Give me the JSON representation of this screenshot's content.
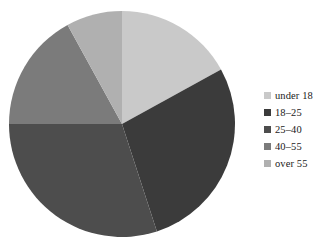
{
  "chart_data": {
    "type": "pie",
    "title": "",
    "xlabel": "",
    "ylabel": "",
    "grid": false,
    "legend_position": "right",
    "start_angle_deg": 0,
    "direction": "clockwise",
    "categories": [
      "under 18",
      "18–25",
      "25–40",
      "40–55",
      "over 55"
    ],
    "values": [
      17,
      28,
      30,
      17,
      8
    ],
    "units": "percent",
    "colors": [
      "#c9c9c9",
      "#3b3b3b",
      "#4d4d4d",
      "#7b7b7b",
      "#b0b0b0"
    ],
    "slices": [
      {
        "label": "under 18",
        "value": 17,
        "color": "#c9c9c9",
        "start_deg": 0,
        "end_deg": 61.2
      },
      {
        "label": "18–25",
        "value": 28,
        "color": "#3b3b3b",
        "start_deg": 61.2,
        "end_deg": 162.0
      },
      {
        "label": "25–40",
        "value": 30,
        "color": "#4d4d4d",
        "start_deg": 162.0,
        "end_deg": 270.0
      },
      {
        "label": "40–55",
        "value": 17,
        "color": "#7b7b7b",
        "start_deg": 270.0,
        "end_deg": 331.2
      },
      {
        "label": "over 55",
        "value": 8,
        "color": "#b0b0b0",
        "start_deg": 331.2,
        "end_deg": 360.0
      }
    ]
  },
  "legend": {
    "items": [
      {
        "label": "under 18",
        "color": "#c9c9c9"
      },
      {
        "label": "18–25",
        "color": "#3b3b3b"
      },
      {
        "label": "25–40",
        "color": "#4d4d4d"
      },
      {
        "label": "40–55",
        "color": "#7b7b7b"
      },
      {
        "label": "over 55",
        "color": "#b0b0b0"
      }
    ]
  },
  "figure": {
    "background": "#ffffff",
    "pie_center_x": 114,
    "pie_center_y": 114,
    "pie_radius": 113
  }
}
